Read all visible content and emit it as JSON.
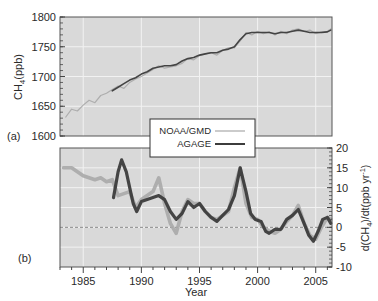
{
  "chart_data": [
    {
      "panel": "(a)",
      "type": "line",
      "title": "",
      "xlabel": "",
      "ylabel": "CH4 (ppb)",
      "ylabel_main": "CH",
      "ylabel_sub": "4",
      "ylabel_rest": " (ppb)",
      "xlim": [
        1983,
        2006.4
      ],
      "ylim": [
        1600,
        1800
      ],
      "yticks": [
        1600,
        1650,
        1700,
        1750,
        1800
      ],
      "ytick_labels": [
        "1600",
        "1650",
        "1700",
        "1750",
        "1800"
      ],
      "grid": true,
      "series": [
        {
          "name": "NOAA/GMD",
          "color": "#a8a8a8",
          "x": [
            1983.5,
            1984.0,
            1984.5,
            1985.0,
            1985.5,
            1986.0,
            1986.5,
            1987.0,
            1987.5,
            1988.0,
            1988.5,
            1989.0,
            1989.5,
            1990.0,
            1990.5,
            1991.0,
            1991.5,
            1992.0,
            1992.5,
            1993.0,
            1993.5,
            1994.0,
            1994.5,
            1995.0,
            1995.5,
            1996.0,
            1996.5,
            1997.0,
            1997.5,
            1998.0,
            1998.5,
            1999.0,
            1999.5,
            2000.0,
            2000.5,
            2001.0,
            2001.5,
            2002.0,
            2002.5,
            2003.0,
            2003.5,
            2004.0,
            2004.5,
            2005.0,
            2005.5,
            2006.0,
            2006.3
          ],
          "y": [
            1632,
            1645,
            1642,
            1652,
            1660,
            1656,
            1668,
            1672,
            1678,
            1684,
            1680,
            1690,
            1696,
            1700,
            1706,
            1712,
            1718,
            1714,
            1716,
            1718,
            1722,
            1730,
            1728,
            1735,
            1738,
            1740,
            1736,
            1744,
            1748,
            1748,
            1760,
            1774,
            1770,
            1776,
            1772,
            1775,
            1770,
            1776,
            1772,
            1778,
            1780,
            1776,
            1778,
            1772,
            1775,
            1776,
            1780
          ]
        },
        {
          "name": "AGAGE",
          "color": "#3c3c3c",
          "x": [
            1987.5,
            1988.0,
            1988.5,
            1989.0,
            1989.5,
            1990.0,
            1990.5,
            1991.0,
            1991.5,
            1992.0,
            1992.5,
            1993.0,
            1993.5,
            1994.0,
            1994.5,
            1995.0,
            1995.5,
            1996.0,
            1996.5,
            1997.0,
            1997.5,
            1998.0,
            1998.5,
            1999.0,
            1999.5,
            2000.0,
            2000.5,
            2001.0,
            2001.5,
            2002.0,
            2002.5,
            2003.0,
            2003.5,
            2004.0,
            2004.5,
            2005.0,
            2005.5,
            2006.0,
            2006.3
          ],
          "y": [
            1676,
            1682,
            1688,
            1694,
            1698,
            1704,
            1708,
            1714,
            1716,
            1718,
            1718,
            1720,
            1726,
            1730,
            1732,
            1736,
            1738,
            1740,
            1740,
            1744,
            1746,
            1750,
            1762,
            1772,
            1774,
            1774,
            1774,
            1774,
            1772,
            1774,
            1774,
            1776,
            1778,
            1776,
            1774,
            1774,
            1774,
            1775,
            1778
          ]
        }
      ],
      "annotations": [
        "(a)"
      ]
    },
    {
      "panel": "(b)",
      "type": "line",
      "title": "",
      "xlabel": "Year",
      "ylabel": "d(CH4)/dt (ppb yr-1)",
      "ylabel_parts": [
        "d(CH",
        "4",
        ")/dt(ppb yr",
        "-1",
        ")"
      ],
      "xlim": [
        1983,
        2006.4
      ],
      "ylim": [
        -10,
        20
      ],
      "xticks": [
        1985,
        1990,
        1995,
        2000,
        2005
      ],
      "xtick_labels": [
        "1985",
        "1990",
        "1995",
        "2000",
        "2005"
      ],
      "yticks": [
        -10,
        -5,
        0,
        5,
        10,
        15,
        20
      ],
      "ytick_labels": [
        "-10",
        "-5",
        "0",
        "5",
        "10",
        "15",
        "20"
      ],
      "yaxis_position": "right",
      "zero_line": "dashed",
      "grid": true,
      "series": [
        {
          "name": "NOAA/GMD",
          "color": "#a8a8a8",
          "x": [
            1983.3,
            1984.0,
            1984.5,
            1985.0,
            1985.5,
            1986.0,
            1986.5,
            1987.0,
            1987.5,
            1988.0,
            1988.5,
            1989.0,
            1989.5,
            1990.0,
            1990.5,
            1991.0,
            1991.5,
            1992.0,
            1992.5,
            1993.0,
            1993.5,
            1994.0,
            1994.5,
            1995.0,
            1995.5,
            1996.0,
            1996.5,
            1997.0,
            1997.5,
            1998.0,
            1998.5,
            1999.0,
            1999.5,
            2000.0,
            2000.5,
            2001.0,
            2001.5,
            2002.0,
            2002.5,
            2003.0,
            2003.5,
            2004.0,
            2004.5,
            2005.0,
            2005.5,
            2006.0,
            2006.3
          ],
          "y": [
            15,
            15,
            14,
            13,
            12.5,
            12,
            12.5,
            11.5,
            12,
            8,
            8.5,
            9,
            5,
            7,
            8,
            9,
            12.5,
            6,
            1,
            -1.5,
            4,
            7,
            6,
            6,
            4,
            2.5,
            2,
            3,
            4,
            10,
            15,
            6,
            2.5,
            2,
            0,
            -1,
            -1.5,
            -0.5,
            1.5,
            3,
            5.5,
            1,
            -2,
            -3,
            0,
            2.5,
            2
          ]
        },
        {
          "name": "AGAGE",
          "color": "#3c3c3c",
          "x": [
            1987.6,
            1988.0,
            1988.3,
            1988.7,
            1989.0,
            1989.3,
            1989.6,
            1990.0,
            1990.5,
            1991.0,
            1991.5,
            1992.0,
            1992.5,
            1993.0,
            1993.5,
            1994.0,
            1994.5,
            1995.0,
            1995.5,
            1996.0,
            1996.5,
            1997.0,
            1997.5,
            1998.0,
            1998.5,
            1999.0,
            1999.4,
            1999.8,
            2000.3,
            2000.7,
            2001.0,
            2001.5,
            2002.0,
            2002.5,
            2003.0,
            2003.5,
            2004.0,
            2004.4,
            2004.8,
            2005.2,
            2005.6,
            2006.0,
            2006.3
          ],
          "y": [
            7.5,
            14,
            17,
            14,
            10,
            6,
            4,
            6.5,
            7,
            7.5,
            8,
            7,
            4,
            2,
            3.5,
            6.5,
            5,
            6,
            4,
            2.5,
            1.5,
            3,
            4.5,
            8,
            15,
            9,
            3.5,
            2,
            1.5,
            -1,
            -1.5,
            -0.5,
            -0.5,
            2,
            3,
            4.5,
            1,
            -2,
            -3.5,
            -1,
            2,
            2.5,
            1
          ]
        }
      ],
      "annotations": [
        "(b)"
      ]
    }
  ],
  "legend": {
    "position": "between panels, center",
    "entries": [
      {
        "label": "NOAA/GMD",
        "color": "#a8a8a8"
      },
      {
        "label": "AGAGE",
        "color": "#3c3c3c"
      }
    ]
  },
  "labels": {
    "panel_a": "(a)",
    "panel_b": "(b)",
    "xlabel": "Year",
    "ylabel_a_main": "CH",
    "ylabel_a_sub": "4",
    "ylabel_a_rest": "(ppb)",
    "legend_noaa": "NOAA/GMD",
    "legend_agage": "AGAGE"
  },
  "colors": {
    "plot_bg": "#d9d9d9",
    "grid": "#f2f2f2",
    "frame": "#555555",
    "noaa": "#a8a8a8",
    "agage": "#3c3c3c",
    "zero_line": "#8a8a8a"
  }
}
